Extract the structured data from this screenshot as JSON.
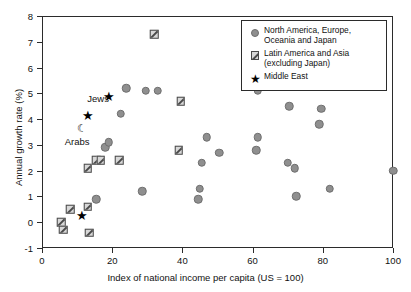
{
  "chart_data": {
    "type": "scatter",
    "title": "",
    "xlabel": "Index of national income per capita (US = 100)",
    "ylabel": "Annual growth rate (%)",
    "xlim": [
      0,
      100
    ],
    "ylim": [
      -1,
      8
    ],
    "xticks": [
      0,
      20,
      40,
      60,
      80,
      100
    ],
    "yticks": [
      -1,
      0,
      1,
      2,
      3,
      4,
      5,
      6,
      7,
      8
    ],
    "grid": false,
    "legend_position": "top-right",
    "series": [
      {
        "name": "North America, Europe, Oceania and Japan",
        "marker": "circle",
        "color": "#8f8f8f",
        "points": [
          [
            15.5,
            0.9
          ],
          [
            18.0,
            2.9
          ],
          [
            19.0,
            3.1
          ],
          [
            22.5,
            4.2
          ],
          [
            24.0,
            5.2
          ],
          [
            28.5,
            1.2
          ],
          [
            29.5,
            5.1
          ],
          [
            33.0,
            5.1
          ],
          [
            44.5,
            0.9
          ],
          [
            45.0,
            1.3
          ],
          [
            45.5,
            2.3
          ],
          [
            47.0,
            3.3
          ],
          [
            50.5,
            2.7
          ],
          [
            61.0,
            2.8
          ],
          [
            61.5,
            3.3
          ],
          [
            61.5,
            5.1
          ],
          [
            70.0,
            2.3
          ],
          [
            70.5,
            4.5
          ],
          [
            72.0,
            2.1
          ],
          [
            72.5,
            1.0
          ],
          [
            79.0,
            3.8
          ],
          [
            79.5,
            4.4
          ],
          [
            82.0,
            1.3
          ],
          [
            100.0,
            2.0
          ]
        ]
      },
      {
        "name": "Latin America and Asia (excluding Japan)",
        "marker": "hatched-square",
        "color": "#d8d8d8",
        "points": [
          [
            5.5,
            0.0
          ],
          [
            6.0,
            -0.3
          ],
          [
            8.0,
            0.5
          ],
          [
            13.0,
            0.6
          ],
          [
            13.0,
            2.1
          ],
          [
            13.5,
            -0.4
          ],
          [
            15.5,
            2.4
          ],
          [
            16.8,
            2.4
          ],
          [
            22.0,
            2.4
          ],
          [
            32.0,
            7.3
          ],
          [
            39.0,
            2.8
          ],
          [
            39.5,
            4.7
          ]
        ]
      },
      {
        "name": "Middle East",
        "marker": "star",
        "color": "#000000",
        "points": [
          [
            11.5,
            0.2
          ],
          [
            13.0,
            4.1
          ],
          [
            19.0,
            4.8
          ]
        ]
      }
    ],
    "annotations": [
      {
        "label": "Jews",
        "x": 16.0,
        "y": 4.8,
        "marker": "none"
      },
      {
        "label": "Arabs",
        "x": 10.0,
        "y": 3.15,
        "marker": "none"
      },
      {
        "label": "",
        "x": 11.3,
        "y": 3.6,
        "marker": "crescent-moon",
        "glyph": "☾"
      }
    ]
  },
  "legend": {
    "items": [
      {
        "marker": "circle",
        "label": "North America, Europe, Oceania and Japan"
      },
      {
        "marker": "hatched-square",
        "label": "Latin America and Asia (excluding Japan)"
      },
      {
        "marker": "star",
        "label": "Middle East"
      }
    ]
  },
  "axis": {
    "x_title": "Index of national income per capita (US = 100)",
    "y_title": "Annual growth rate (%)",
    "x_tick_labels": [
      "0",
      "20",
      "40",
      "60",
      "80",
      "100"
    ],
    "y_tick_labels": [
      "-1",
      "0",
      "1",
      "2",
      "3",
      "4",
      "5",
      "6",
      "7",
      "8"
    ]
  }
}
